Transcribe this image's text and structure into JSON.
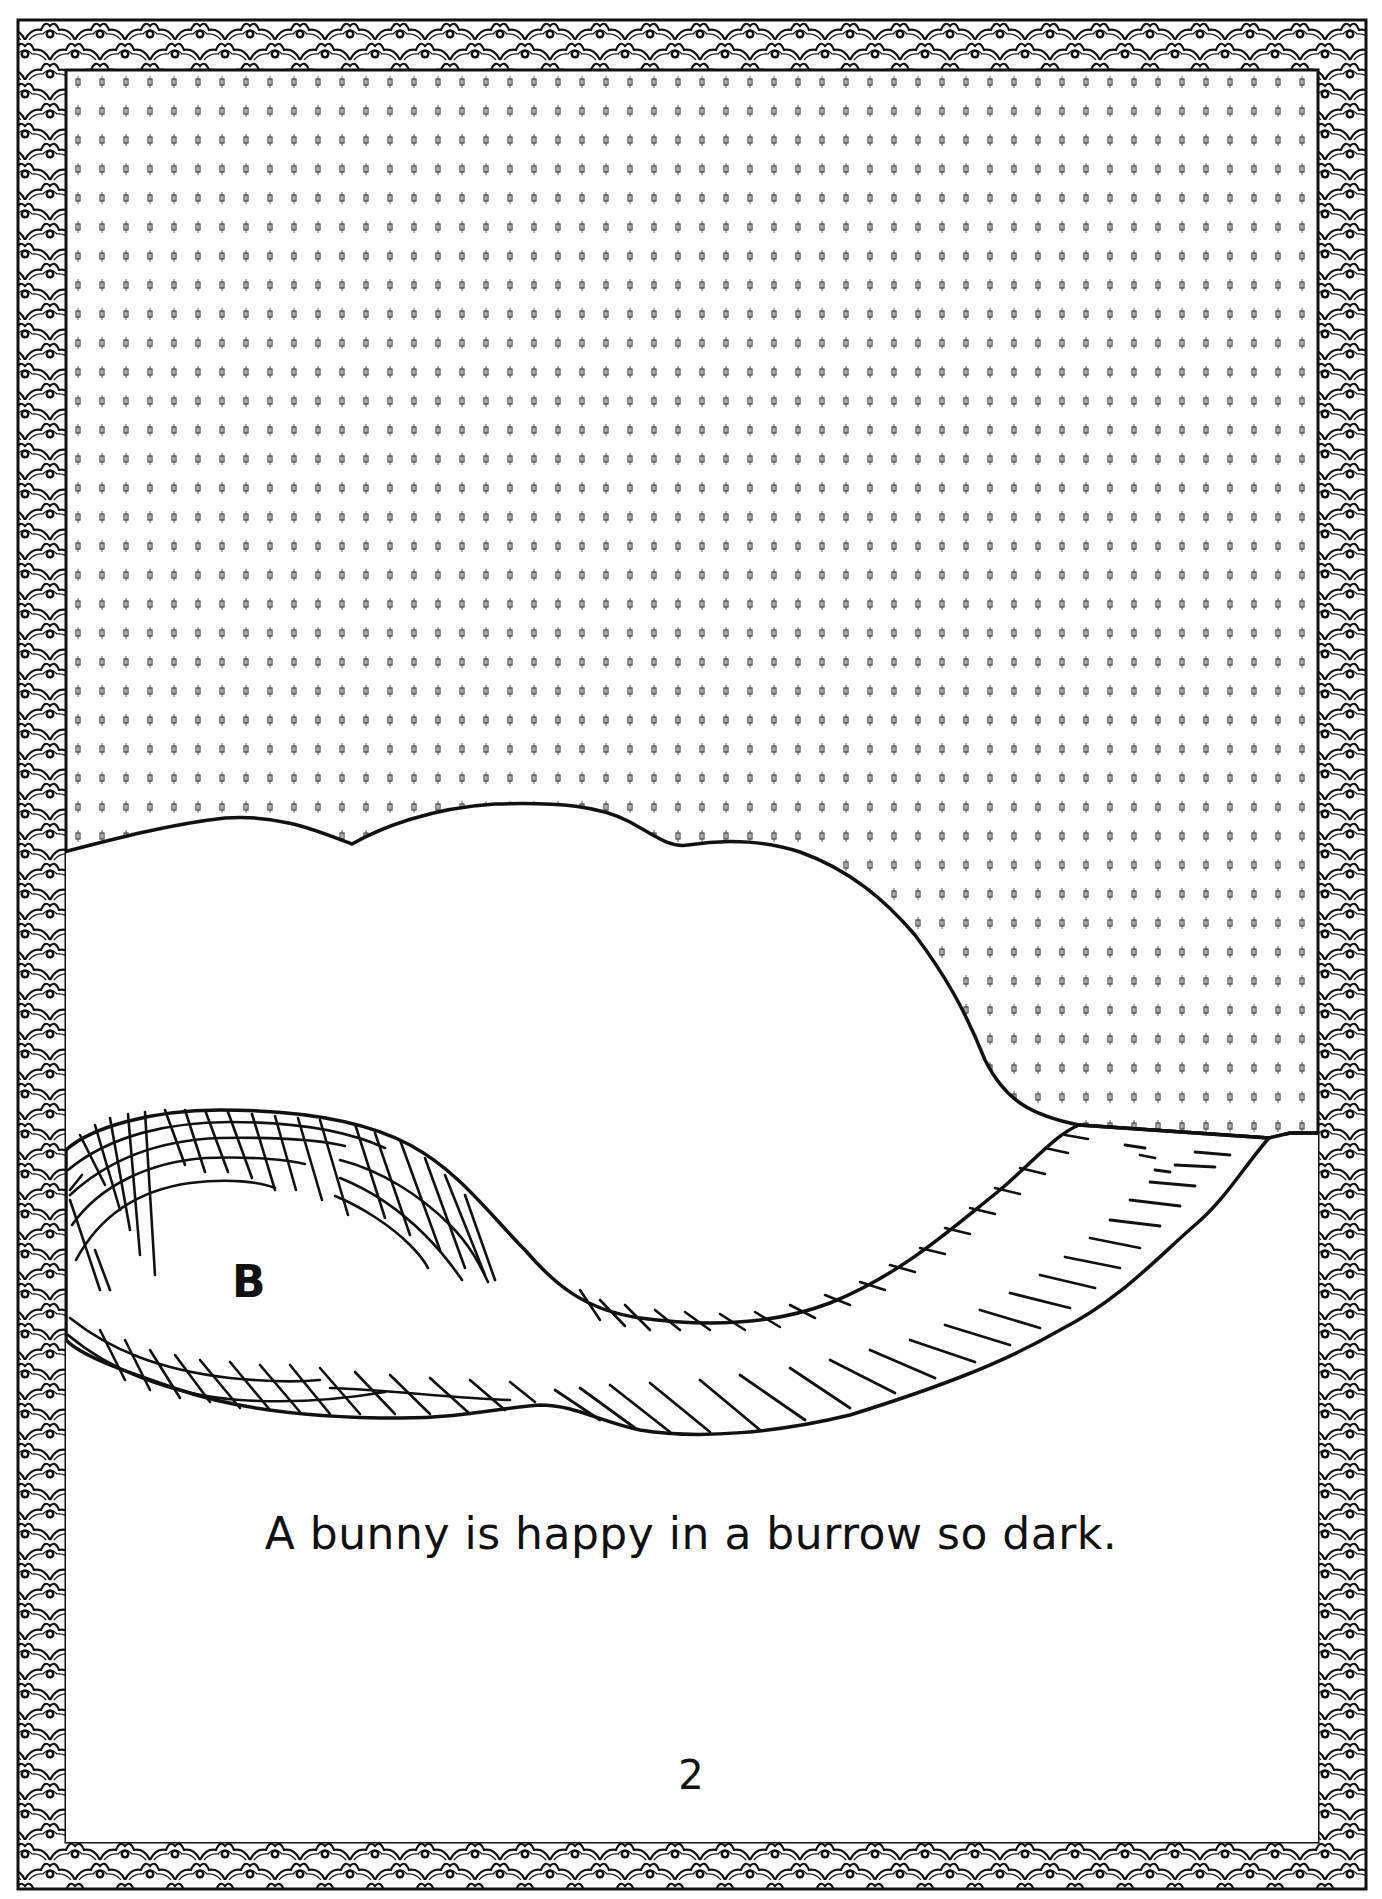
{
  "page": {
    "type": "coloring-book-page",
    "caption": "A bunny is happy in a burrow so dark.",
    "page_number": "2",
    "region_label": "B"
  },
  "illustration": {
    "scene": "hill with underground burrow tunnel",
    "sky_fill": "dotted-pattern",
    "border_style": "scalloped-wave-pattern",
    "colors": {
      "ink": "#111111",
      "paper": "#ffffff"
    }
  }
}
